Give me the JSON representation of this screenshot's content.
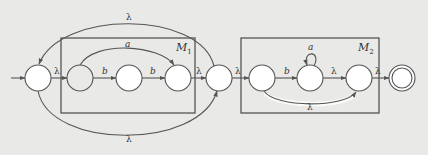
{
  "diagram": {
    "type": "nfa-concatenation-star",
    "boxes": [
      {
        "id": "M1",
        "label": "M",
        "subscript": "1"
      },
      {
        "id": "M2",
        "label": "M",
        "subscript": "2"
      }
    ],
    "states": [
      {
        "id": "q0",
        "initial": true,
        "final": false,
        "fill": "#ffffff"
      },
      {
        "id": "m1a",
        "box": "M1",
        "fill": "#e9e9e7"
      },
      {
        "id": "m1b",
        "box": "M1",
        "fill": "#ffffff"
      },
      {
        "id": "m1c",
        "box": "M1",
        "fill": "#ffffff"
      },
      {
        "id": "q1",
        "fill": "#ffffff"
      },
      {
        "id": "m2a",
        "box": "M2",
        "fill": "#ffffff"
      },
      {
        "id": "m2b",
        "box": "M2",
        "fill": "#ffffff"
      },
      {
        "id": "m2c",
        "box": "M2",
        "fill": "#ffffff"
      },
      {
        "id": "qf",
        "final": true,
        "fill": "#ffffff"
      }
    ],
    "edges": [
      {
        "from": "q0",
        "to": "m1a",
        "label": "λ"
      },
      {
        "from": "m1a",
        "to": "m1b",
        "label": "b"
      },
      {
        "from": "m1b",
        "to": "m1c",
        "label": "b"
      },
      {
        "from": "m1a",
        "to": "m1c",
        "label": "a"
      },
      {
        "from": "m1c",
        "to": "q1",
        "label": "λ"
      },
      {
        "from": "q1",
        "to": "q0",
        "label": "λ",
        "curve": "top"
      },
      {
        "from": "q0",
        "to": "q1",
        "label": "λ",
        "curve": "bottom"
      },
      {
        "from": "q1",
        "to": "m2a",
        "label": "λ"
      },
      {
        "from": "m2a",
        "to": "m2b",
        "label": "b"
      },
      {
        "from": "m2b",
        "to": "m2b",
        "label": "a",
        "loop": true
      },
      {
        "from": "m2b",
        "to": "m2c",
        "label": "λ"
      },
      {
        "from": "m2a",
        "to": "m2c",
        "label": "λ",
        "curve": "bottom"
      },
      {
        "from": "m2c",
        "to": "qf",
        "label": "λ"
      }
    ],
    "colors": {
      "background": "#e9e9e7",
      "stroke": "#555555",
      "state_fill": "#ffffff"
    }
  }
}
